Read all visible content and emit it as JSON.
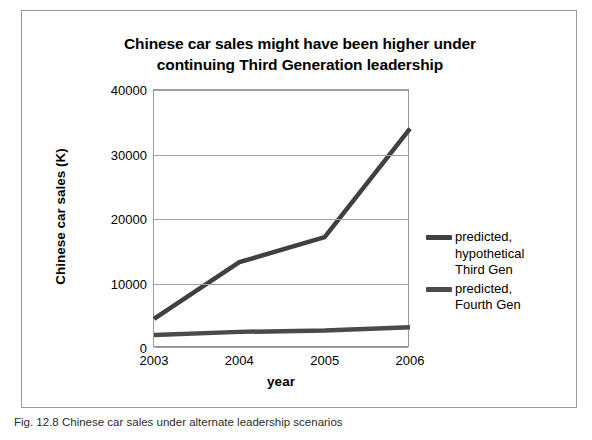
{
  "figure": {
    "caption": "Fig. 12.8 Chinese car sales under alternate leadership scenarios"
  },
  "chart_data": {
    "type": "line",
    "title": "Chinese car sales might have been higher under continuing Third Generation leadership",
    "title_line1": "Chinese car sales might have been higher under",
    "title_line2": "continuing Third Generation leadership",
    "xlabel": "year",
    "ylabel": "Chinese car sales (K)",
    "categories": [
      "2003",
      "2004",
      "2005",
      "2006"
    ],
    "x": [
      2003,
      2004,
      2005,
      2006
    ],
    "ylim": [
      0,
      40000
    ],
    "yticks": [
      0,
      10000,
      20000,
      30000,
      40000
    ],
    "ytick_labels": [
      "0",
      "10000",
      "20000",
      "30000",
      "40000"
    ],
    "grid": true,
    "legend_position": "right",
    "series": [
      {
        "name": "predicted, hypothetical Third Gen",
        "label_line1": "predicted,",
        "label_line2": "hypothetical",
        "label_line3": "Third Gen",
        "color": "#404040",
        "values": [
          4500,
          13300,
          17200,
          34000
        ]
      },
      {
        "name": "predicted, Fourth Gen",
        "label_line1": "predicted,",
        "label_line2": "Fourth Gen",
        "color": "#4a4a4a",
        "values": [
          2000,
          2500,
          2700,
          3200
        ]
      }
    ]
  }
}
